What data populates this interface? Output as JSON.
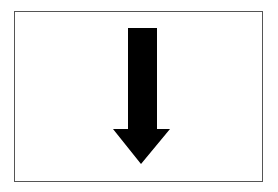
{
  "figure": {
    "frame_color": "#555555",
    "background_color": "#ffffff",
    "arrow": {
      "icon": "arrow-down-icon",
      "direction": "down",
      "color": "#000000"
    }
  }
}
